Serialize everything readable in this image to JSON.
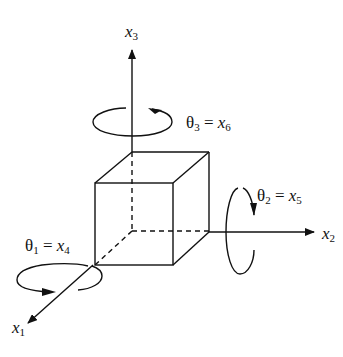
{
  "figure": {
    "axes": [
      {
        "id": "x3",
        "var": "x",
        "sub": "3"
      },
      {
        "id": "x2",
        "var": "x",
        "sub": "2"
      },
      {
        "id": "x1",
        "var": "x",
        "sub": "1"
      }
    ],
    "rotations": [
      {
        "id": "theta3",
        "theta_sub": "3",
        "eq": "=",
        "var": "x",
        "sub": "6"
      },
      {
        "id": "theta2",
        "theta_sub": "2",
        "eq": "=",
        "var": "x",
        "sub": "5"
      },
      {
        "id": "theta1",
        "theta_sub": "1",
        "eq": "=",
        "var": "x",
        "sub": "4"
      }
    ],
    "theta_symbol": "θ",
    "line_color": "#111111"
  }
}
